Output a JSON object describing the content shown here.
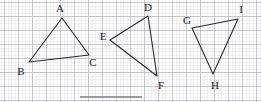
{
  "figure": {
    "kind": "geometry-worksheet-figure",
    "width": 261,
    "height": 102,
    "background_color": "#ffffff",
    "grid": {
      "visible": true,
      "minor_spacing_px": 3.5,
      "major_spacing_px": 14,
      "origin_x_px": 4,
      "origin_y_px": 2,
      "minor_color": "#e6e6ea",
      "major_color": "#b9b9c2"
    },
    "stroke": {
      "color": "#2a2a2a",
      "width_px": 1.1
    },
    "footer_rule": {
      "visible": true,
      "color": "#9b9b9b",
      "x_px": 80,
      "y_px": 96,
      "length_px": 62,
      "thickness_px": 1.6
    }
  },
  "chart_data": {
    "type": "scatter",
    "title": "",
    "xlabel": "",
    "ylabel": "",
    "grid": true,
    "legend_position": "none",
    "xlim": [
      0,
      261
    ],
    "ylim": [
      102,
      0
    ],
    "note": "Three triangles drawn on graph paper; coordinates are pixel positions of labelled vertices.",
    "shapes": [
      {
        "name": "triangle-abc",
        "closed": true,
        "vertices": [
          {
            "label": "A",
            "x": 62,
            "y": 18,
            "label_x": 60,
            "label_y": 8
          },
          {
            "label": "B",
            "x": 29,
            "y": 62,
            "label_x": 21,
            "label_y": 71
          },
          {
            "label": "C",
            "x": 89,
            "y": 55,
            "label_x": 93,
            "label_y": 62
          }
        ]
      },
      {
        "name": "triangle-def",
        "closed": true,
        "vertices": [
          {
            "label": "D",
            "x": 148,
            "y": 16,
            "label_x": 148,
            "label_y": 7
          },
          {
            "label": "E",
            "x": 110,
            "y": 40,
            "label_x": 103,
            "label_y": 36
          },
          {
            "label": "F",
            "x": 157,
            "y": 76,
            "label_x": 161,
            "label_y": 85
          }
        ]
      },
      {
        "name": "triangle-ghi",
        "closed": true,
        "vertices": [
          {
            "label": "G",
            "x": 192,
            "y": 28,
            "label_x": 187,
            "label_y": 20
          },
          {
            "label": "I",
            "x": 238,
            "y": 19,
            "label_x": 241,
            "label_y": 9
          },
          {
            "label": "H",
            "x": 213,
            "y": 74,
            "label_x": 215,
            "label_y": 85
          }
        ]
      }
    ]
  }
}
